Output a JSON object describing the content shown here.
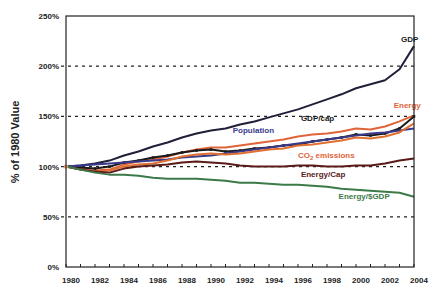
{
  "chart_data": {
    "type": "line",
    "title": "",
    "xlabel": "",
    "ylabel": "% of 1980 Value",
    "xlim": [
      1980,
      2004
    ],
    "ylim": [
      0,
      250
    ],
    "grid": "horizontal-dashed",
    "x_ticks": [
      1980,
      1982,
      1984,
      1986,
      1988,
      1990,
      1992,
      1994,
      1996,
      1998,
      2000,
      2002,
      2004
    ],
    "x_tick_labels": [
      "1980",
      "1982",
      "1984",
      "1986",
      "1988",
      "1990",
      "1992",
      "1994",
      "1996",
      "1998",
      "2000",
      "2002",
      "2004"
    ],
    "y_ticks": [
      0,
      50,
      100,
      150,
      200,
      250
    ],
    "y_tick_labels": [
      "0%",
      "50%",
      "100%",
      "150%",
      "200%",
      "250%"
    ],
    "x": [
      1980,
      1981,
      1982,
      1983,
      1984,
      1985,
      1986,
      1987,
      1988,
      1989,
      1990,
      1991,
      1992,
      1993,
      1994,
      1995,
      1996,
      1997,
      1998,
      1999,
      2000,
      2001,
      2002,
      2003,
      2004
    ],
    "series": [
      {
        "name": "GDP",
        "label": "GDP",
        "color": "#1f1f3a",
        "values": [
          100,
          101,
          103,
          106,
          111,
          115,
          120,
          124,
          129,
          133,
          136,
          138,
          142,
          145,
          149,
          153,
          157,
          162,
          167,
          172,
          178,
          182,
          186,
          197,
          220
        ]
      },
      {
        "name": "Energy",
        "label": "Energy",
        "color": "#e0643a",
        "values": [
          100,
          98,
          96,
          97,
          102,
          105,
          107,
          110,
          114,
          117,
          119,
          119,
          121,
          123,
          125,
          127,
          130,
          132,
          133,
          135,
          138,
          137,
          140,
          145,
          151
        ]
      },
      {
        "name": "GDP/cap",
        "label": "GDP/cap",
        "color": "#1a1a1a",
        "markers": true,
        "values": [
          100,
          99,
          98,
          100,
          104,
          106,
          109,
          111,
          114,
          116,
          117,
          115,
          116,
          118,
          119,
          121,
          122,
          125,
          127,
          129,
          132,
          131,
          133,
          138,
          150
        ]
      },
      {
        "name": "Population",
        "label": "Population",
        "color": "#3a3a8c",
        "values": [
          100,
          101,
          102,
          103,
          104,
          105,
          106,
          107,
          109,
          110,
          111,
          113,
          115,
          117,
          119,
          121,
          123,
          125,
          127,
          129,
          131,
          133,
          134,
          136,
          138
        ]
      },
      {
        "name": "CO2 emissions",
        "label": "CO2 emissions",
        "color": "#e07030",
        "values": [
          100,
          97,
          95,
          96,
          100,
          102,
          103,
          106,
          110,
          112,
          113,
          112,
          113,
          115,
          117,
          118,
          121,
          122,
          124,
          126,
          129,
          128,
          130,
          134,
          143
        ]
      },
      {
        "name": "Energy/Cap",
        "label": "Energy/Cap",
        "color": "#5a1a1a",
        "values": [
          100,
          97,
          95,
          94,
          98,
          100,
          101,
          102,
          104,
          105,
          104,
          103,
          101,
          100,
          100,
          100,
          101,
          101,
          100,
          100,
          101,
          101,
          103,
          106,
          108
        ]
      },
      {
        "name": "Energy/$GDP",
        "label": "Energy/$GDP",
        "color": "#3d7a4a",
        "values": [
          100,
          97,
          94,
          92,
          92,
          91,
          89,
          88,
          88,
          88,
          87,
          86,
          84,
          84,
          83,
          82,
          82,
          81,
          80,
          78,
          77,
          76,
          75,
          74,
          70
        ]
      }
    ],
    "annotations": [
      {
        "text": "GDP",
        "x": 2003.1,
        "y": 224,
        "color": "#1a1a1a"
      },
      {
        "text": "Energy",
        "x": 2002.6,
        "y": 158,
        "color": "#e0643a"
      },
      {
        "text": "GDP/cap",
        "x": 1996.2,
        "y": 145,
        "color": "#1a1a1a"
      },
      {
        "text": "Population",
        "x": 1991.5,
        "y": 133,
        "color": "#3a3a8c"
      },
      {
        "text": "CO",
        "sub": "2",
        "rest": " emissions",
        "x": 1996.0,
        "y": 109,
        "color": "#e0643a"
      },
      {
        "text": "Energy/Cap",
        "x": 1996.2,
        "y": 90,
        "color": "#5a1a1a"
      },
      {
        "text": "Energy/$GDP",
        "x": 1998.8,
        "y": 68,
        "color": "#3d7a4a"
      }
    ]
  }
}
